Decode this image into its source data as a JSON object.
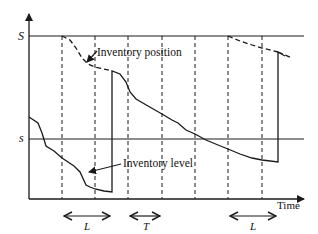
{
  "diagram": {
    "axes": {
      "x_label": "Time",
      "y_ticks": [
        {
          "label": "S",
          "meaning": "order-up-to level"
        },
        {
          "label": "s",
          "meaning": "reorder point"
        }
      ]
    },
    "annotations": {
      "inventory_position": "Inventory position",
      "inventory_level": "Inventory level"
    },
    "intervals": [
      {
        "label": "L",
        "meaning": "lead time"
      },
      {
        "label": "T",
        "meaning": "review period"
      },
      {
        "label": "L",
        "meaning": "lead time"
      }
    ],
    "colors": {
      "line": "#1a1a1a",
      "background": "#ffffff"
    }
  }
}
